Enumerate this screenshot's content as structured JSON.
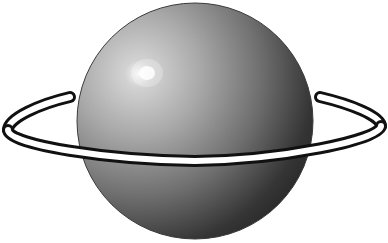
{
  "image": {
    "subject": "Ringed planet illustration",
    "width": 388,
    "height": 243,
    "background": "#ffffff"
  },
  "planet": {
    "center_x": 195,
    "center_y": 121,
    "radius": 118,
    "highlight": {
      "x": 147,
      "y": 73
    },
    "colors": {
      "highlight": "#f4f4f4",
      "light": "#b4b4b4",
      "mid": "#7a7a7a",
      "dark": "#2e2e2e",
      "shadow": "#1a1a1a",
      "edge": "#3a3a3a"
    }
  },
  "ring": {
    "fill": "#ffffff",
    "outline": "#111111"
  }
}
